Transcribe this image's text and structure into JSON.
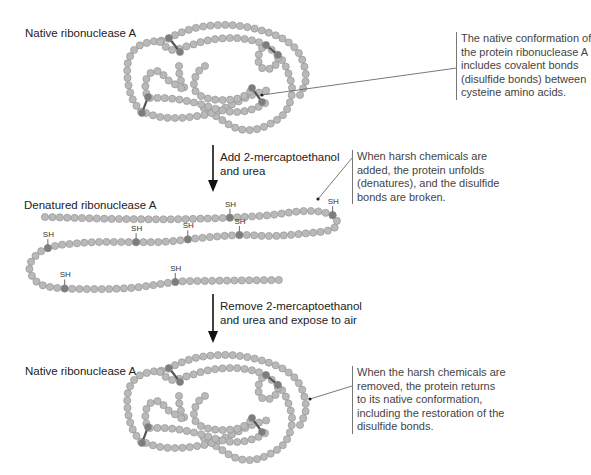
{
  "panels": {
    "top": {
      "title": "Native ribonuclease A",
      "callout": [
        "The native conformation of",
        "the protein ribonuclease A",
        "includes covalent bonds",
        "(disulfide bonds) between",
        "cysteine amino acids."
      ]
    },
    "step1": {
      "lines": [
        "Add 2-mercaptoethanol",
        "and urea"
      ]
    },
    "middle": {
      "title": "Denatured ribonuclease A",
      "callout": [
        "When harsh chemicals are",
        "added, the protein unfolds",
        "(denatures), and the disulfide",
        "bonds are broken."
      ],
      "sh_label": "SH"
    },
    "step2": {
      "lines": [
        "Remove 2-mercaptoethanol",
        "and urea and expose to air"
      ]
    },
    "bottom": {
      "title": "Native ribonuclease A",
      "callout": [
        "When the harsh chemicals are",
        "removed, the protein returns",
        "to its native conformation,",
        "including the restoration of the",
        "disulfide bonds."
      ]
    }
  },
  "colors": {
    "bead": "#b9b9b9",
    "bead_stroke": "#8f8f8f",
    "cysteine": "#7d7d7d",
    "bond": "#555555",
    "arrow": "#111111"
  }
}
